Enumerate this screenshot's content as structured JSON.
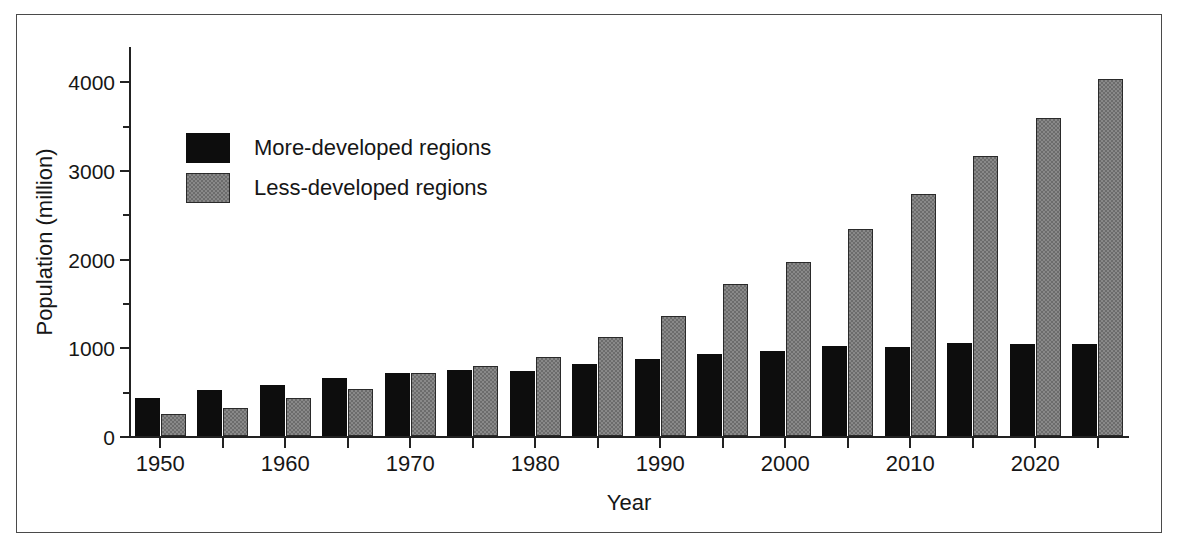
{
  "chart_data": {
    "type": "bar",
    "title": "",
    "subtitle": "",
    "xlabel": "Year",
    "ylabel": "Population (million)",
    "categories": [
      "1950",
      "1955",
      "1960",
      "1965",
      "1970",
      "1975",
      "1980",
      "1985",
      "1990",
      "1995",
      "2000",
      "2005",
      "2010",
      "2015",
      "2020",
      "2025"
    ],
    "x_tick_labels": [
      "1950",
      "1960",
      "1970",
      "1980",
      "1990",
      "2000",
      "2010",
      "2020"
    ],
    "y_tick_labels": [
      "0",
      "1000",
      "2000",
      "3000",
      "4000"
    ],
    "y_minor_ticks": [
      500,
      1500,
      2500,
      3500,
      4500
    ],
    "ylim": [
      0,
      4400
    ],
    "xlim_note": "1950 to 2025 in 5-year steps",
    "grid": false,
    "legend_position": "upper-left-inside",
    "series": [
      {
        "name": "More-developed regions",
        "color": "#0d0d0d",
        "pattern": "solid",
        "values": [
          430,
          520,
          570,
          655,
          710,
          740,
          730,
          810,
          865,
          925,
          955,
          1010,
          1000,
          1045,
          1040,
          1040
        ]
      },
      {
        "name": "Less-developed regions",
        "color": "#6c6c6c",
        "pattern": "stipple",
        "values": [
          250,
          320,
          430,
          530,
          710,
          790,
          895,
          1120,
          1355,
          1715,
          1965,
          2340,
          2735,
          3160,
          3590,
          4030
        ]
      }
    ]
  },
  "legend": {
    "items": [
      {
        "label": "More-developed regions",
        "swatch": "black-solid"
      },
      {
        "label": "Less-developed regions",
        "swatch": "gray-stipple"
      }
    ]
  },
  "axes": {
    "y_title": "Population (million)",
    "x_title": "Year"
  }
}
